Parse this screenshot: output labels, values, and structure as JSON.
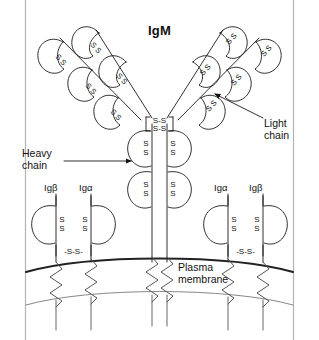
{
  "figure": {
    "title": "IgM",
    "border_color": "#b4b4b4",
    "background_color": "#ffffff",
    "stroke_color": "#1a1a1a",
    "membrane_stroke_color": "#222222",
    "membrane_inner_stroke_color": "#888888"
  },
  "labels": {
    "heavy_chain": "Heavy\nchain",
    "light_chain": "Light\nchain",
    "plasma_membrane": "Plasma\nmembrane",
    "ig_beta_left": "Igβ",
    "ig_alpha_left": "Igα",
    "ig_alpha_right": "Igα",
    "ig_beta_right": "Igβ"
  },
  "bond_text": {
    "sulfur": "S",
    "disulfide_horizontal": "S-S",
    "disulfide_bracketed": "-S-S-"
  },
  "structure": {
    "hinge_disulfides": [
      "S-S",
      "S-S"
    ],
    "heavy_chain_domains_per_side": 2,
    "arm_lobes_per_side": 4,
    "igalpha_igbeta_pairs": 2,
    "transmembrane_helices": 6
  }
}
